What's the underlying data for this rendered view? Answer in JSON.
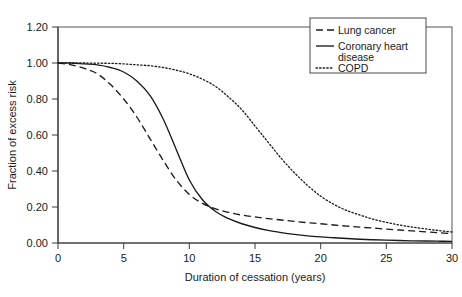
{
  "chart_data": {
    "type": "line",
    "title": "",
    "xlabel": "Duration of cessation (years)",
    "ylabel": "Fraction of excess risk",
    "xlim": [
      0,
      30
    ],
    "ylim": [
      0,
      1.2
    ],
    "xticks": [
      "0",
      "5",
      "10",
      "15",
      "20",
      "25",
      "30"
    ],
    "yticks": [
      "0.00",
      "0.20",
      "0.40",
      "0.60",
      "0.80",
      "1.00",
      "1.20"
    ],
    "grid": false,
    "legend_position": "top-right inside plot",
    "x": [
      0,
      1,
      2,
      3,
      4,
      5,
      6,
      7,
      8,
      9,
      10,
      11,
      12,
      13,
      14,
      15,
      16,
      17,
      18,
      19,
      20,
      21,
      22,
      23,
      24,
      25,
      26,
      27,
      28,
      29,
      30
    ],
    "series": [
      {
        "name": "Lung cancer",
        "style": "dashed",
        "color": "#1a1a1a",
        "values": [
          1.0,
          0.99,
          0.97,
          0.94,
          0.88,
          0.8,
          0.7,
          0.58,
          0.46,
          0.35,
          0.27,
          0.22,
          0.19,
          0.17,
          0.155,
          0.145,
          0.135,
          0.128,
          0.12,
          0.113,
          0.107,
          0.1,
          0.094,
          0.088,
          0.083,
          0.077,
          0.072,
          0.067,
          0.062,
          0.057,
          0.052
        ]
      },
      {
        "name": "Coronary heart disease",
        "style": "solid",
        "color": "#1a1a1a",
        "values": [
          1.0,
          1.0,
          0.995,
          0.99,
          0.975,
          0.95,
          0.9,
          0.82,
          0.69,
          0.52,
          0.35,
          0.24,
          0.175,
          0.135,
          0.107,
          0.086,
          0.07,
          0.058,
          0.048,
          0.04,
          0.034,
          0.029,
          0.025,
          0.021,
          0.018,
          0.016,
          0.014,
          0.012,
          0.011,
          0.01,
          0.009
        ]
      },
      {
        "name": "COPD",
        "style": "dotted",
        "color": "#1a1a1a",
        "values": [
          1.0,
          1.0,
          1.0,
          0.999,
          0.998,
          0.995,
          0.99,
          0.985,
          0.975,
          0.96,
          0.94,
          0.91,
          0.87,
          0.81,
          0.74,
          0.65,
          0.56,
          0.47,
          0.39,
          0.32,
          0.26,
          0.215,
          0.18,
          0.155,
          0.132,
          0.115,
          0.1,
          0.088,
          0.078,
          0.069,
          0.061
        ]
      }
    ],
    "legend": [
      {
        "label": "Lung cancer",
        "style": "dashed"
      },
      {
        "label": "Coronary heart disease",
        "style": "solid"
      },
      {
        "label": "COPD",
        "style": "dotted"
      }
    ]
  },
  "legend_lines": {
    "item0": "Lung cancer",
    "item1_line1": "Coronary heart",
    "item1_line2": "disease",
    "item2": "COPD"
  }
}
